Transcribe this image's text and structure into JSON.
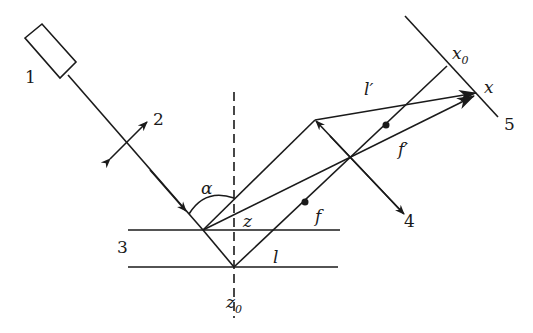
{
  "diagram": {
    "type": "laser triangulation optical scheme",
    "labels": {
      "source": "1",
      "polarizer": "2",
      "sample": "3",
      "lens": "4",
      "detector": "5",
      "angle": "α",
      "z": "z",
      "z0": "z",
      "z0_sub": "0",
      "x": "x",
      "x0": "x",
      "x0_sub": "0",
      "l": "l",
      "l_prime": "l′",
      "f": "f",
      "f_prime": "f′"
    },
    "colors": {
      "stroke": "#1a1a1a",
      "background": "#ffffff"
    }
  }
}
